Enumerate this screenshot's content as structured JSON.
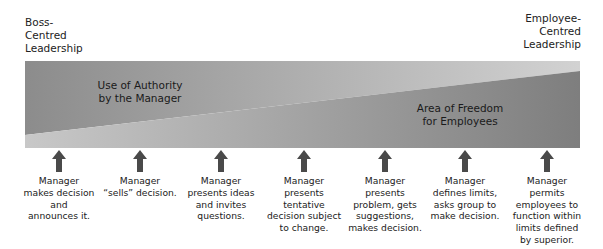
{
  "labels": {
    "left_pole": "Boss-\nCentred\nLeadership",
    "right_pole": "Employee-\nCentred\nLeadership",
    "authority_region": "Use of Authority\nby the Manager",
    "freedom_region": "Area of Freedom\nfor Employees"
  },
  "colors": {
    "dark_grey": "#8a8a8a",
    "light_grey": "#c6c6c6",
    "arrow": "#4a4a4a",
    "text": "#222222"
  },
  "steps": [
    {
      "text": "Manager\nmakes decision\nand\nannounces it.",
      "x": 59
    },
    {
      "text": "Manager\n“sells” decision.",
      "x": 140
    },
    {
      "text": "Manager\npresents ideas\nand invites\nquestions.",
      "x": 221
    },
    {
      "text": "Manager\npresents\ntentative\ndecision subject\nto change.",
      "x": 304
    },
    {
      "text": "Manager\npresents\nproblem, gets\nsuggestions,\nmakes decision.",
      "x": 385
    },
    {
      "text": "Manager\ndefines limits,\nasks group to\nmake decision.",
      "x": 465
    },
    {
      "text": "Manager\npermits\nemployees to\nfunction within\nlimits defined\nby superior.",
      "x": 547
    }
  ]
}
